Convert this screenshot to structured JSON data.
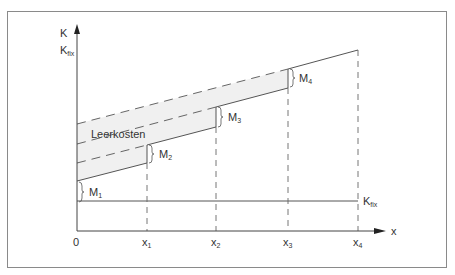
{
  "diagram": {
    "type": "learning-cost-step-diagram",
    "y_axis": {
      "label_top": "K",
      "label_bottom_main": "K",
      "label_bottom_sub": "fix"
    },
    "x_axis": {
      "label": "x",
      "ticks": [
        {
          "main": "0",
          "sub": ""
        },
        {
          "main": "x",
          "sub": "1"
        },
        {
          "main": "x",
          "sub": "2"
        },
        {
          "main": "x",
          "sub": "3"
        },
        {
          "main": "x",
          "sub": "4"
        }
      ]
    },
    "fixed_cost_label": {
      "main": "K",
      "sub": "fix"
    },
    "band_label": "Leerkosten",
    "step_labels": [
      {
        "main": "M",
        "sub": "1"
      },
      {
        "main": "M",
        "sub": "2"
      },
      {
        "main": "M",
        "sub": "3"
      },
      {
        "main": "M",
        "sub": "4"
      }
    ],
    "colors": {
      "line": "#555555",
      "band": "#f0f0f0",
      "frame": "#888888"
    }
  }
}
